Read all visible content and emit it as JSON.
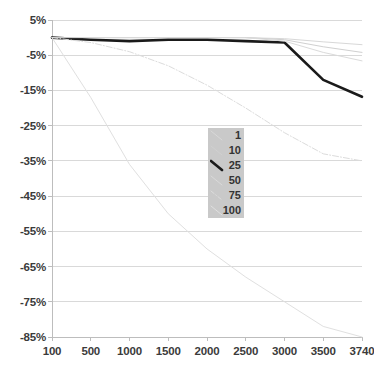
{
  "chart_data": {
    "type": "line",
    "title": "",
    "xlabel": "",
    "ylabel": "",
    "xlim": [
      100,
      3740
    ],
    "ylim": [
      -85,
      5
    ],
    "grid": true,
    "legend_position": "center",
    "legend_title": "",
    "x_ticks": [
      "100",
      "500",
      "1000",
      "1500",
      "2000",
      "2500",
      "3000",
      "3500",
      "3740"
    ],
    "x_tick_values": [
      100,
      500,
      1000,
      1500,
      2000,
      2500,
      3000,
      3500,
      3740
    ],
    "y_ticks": [
      "5%",
      "-5%",
      "-15%",
      "-25%",
      "-35%",
      "-45%",
      "-55%",
      "-65%",
      "-75%",
      "-85%"
    ],
    "y_tick_values": [
      5,
      -5,
      -15,
      -25,
      -35,
      -45,
      -55,
      -65,
      -75,
      -85
    ],
    "x": [
      100,
      500,
      1000,
      1500,
      2000,
      2500,
      3000,
      3500,
      3740
    ],
    "series": [
      {
        "name": "1",
        "color": "#d8d8d8",
        "width": 1,
        "dash": "none",
        "values": [
          0,
          0,
          0,
          0,
          0,
          0,
          -0.3,
          -1.2,
          -2.0
        ]
      },
      {
        "name": "10",
        "color": "#d0d0d0",
        "width": 1,
        "dash": "none",
        "values": [
          0,
          0,
          0,
          0,
          0,
          0,
          -0.6,
          -2.6,
          -4.2
        ]
      },
      {
        "name": "25",
        "color": "#1a1a1a",
        "width": 2.6,
        "dash": "none",
        "values": [
          0,
          -0.6,
          -1.0,
          -0.6,
          -0.6,
          -1.0,
          -1.4,
          -12.0,
          -16.8
        ]
      },
      {
        "name": "50",
        "color": "#dadada",
        "width": 1,
        "dash": "none",
        "values": [
          0,
          0,
          0,
          0,
          0,
          0,
          -1.0,
          -4.2,
          -6.6
        ]
      },
      {
        "name": "75",
        "color": "#dcdcdc",
        "width": 1,
        "dash": "dashdot",
        "values": [
          0,
          -1.4,
          -4.0,
          -8.0,
          -13.5,
          -20.0,
          -27.0,
          -33.0,
          -35.0
        ]
      },
      {
        "name": "100",
        "color": "#e0e0e0",
        "width": 1,
        "dash": "none",
        "values": [
          0,
          -17.0,
          -36.0,
          -50.0,
          -60.0,
          -68.0,
          -75.0,
          -82.0,
          -85.0
        ]
      }
    ],
    "colors": {
      "grid": "#d9d9d9",
      "axis": "#bdbdbd",
      "tick_text": "#3b3b3b",
      "legend_background": "#c9c9c9",
      "highlight_series": "#1a1a1a",
      "plot_background": "#ffffff"
    }
  }
}
